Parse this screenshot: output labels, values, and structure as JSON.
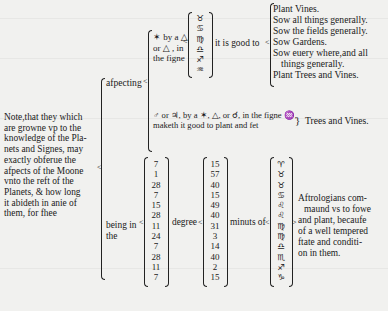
{
  "note": {
    "lines": [
      "Note,that they which",
      "are growne vp to the",
      "knowledge of the Pla-",
      "nets and Signes, may",
      "exactly obferue the",
      "afpects of the Moone",
      "vnto the reft of the",
      "Planets, & how long",
      "it abideth in anie of",
      "them, for fhee"
    ]
  },
  "aspecting": {
    "label": "afpecting",
    "first_clause": {
      "lines": [
        "✶ by a △",
        "or △ , in",
        "the figne"
      ],
      "signs": [
        "♉",
        "♋",
        "♍",
        "♎",
        "♐",
        "♒"
      ],
      "result_label": "it is good to",
      "results": [
        "Plant Vines.",
        "Sow all things generally.",
        "Sow the fields generally.",
        "Sow Gardens.",
        "Sow euery where,and all",
        "things generally.",
        "Plant Trees and Vines."
      ]
    },
    "second_clause": {
      "lines": [
        "♂ or ♃, by a ✶, △, or ☌, in the figne ♒,",
        "maketh it good to plant and fet"
      ],
      "result": "Trees and Vines."
    }
  },
  "being": {
    "label_line1": "being in",
    "label_line2": "the",
    "degree_label": "degree",
    "minutes_label": "minuts of",
    "degrees": [
      "7",
      "1",
      "28",
      "7",
      "15",
      "28",
      "11",
      "24",
      "7",
      "28",
      "11",
      "7"
    ],
    "minutes": [
      "15",
      "57",
      "40",
      "15",
      "49",
      "40",
      "31",
      "3",
      "14",
      "40",
      "2",
      "15"
    ],
    "signs": [
      "♈",
      "♉",
      "♉",
      "♋",
      "♌",
      "♌",
      "♍",
      "♍",
      "♎",
      "♏",
      "♐",
      "♑"
    ],
    "conclusion": [
      "Aftrologians com-",
      "maund vs to fowe",
      "and plant, becaufe",
      "of a well tempered",
      "ftate and conditi-",
      "on in them."
    ]
  }
}
